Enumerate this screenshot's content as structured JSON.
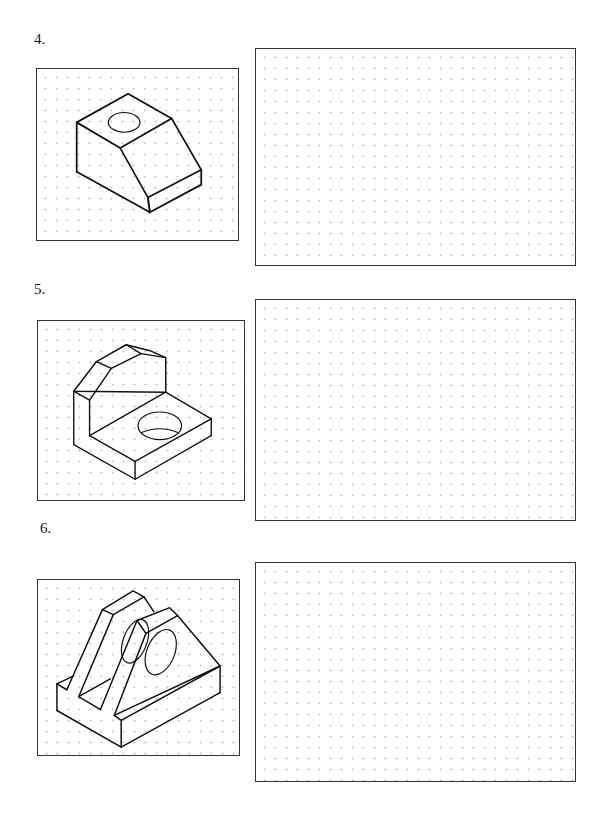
{
  "exercises": [
    {
      "number": "4.",
      "figure": "isometric-block-with-slanted-face-and-hole",
      "answer_area": "dotted-grid-blank"
    },
    {
      "number": "5.",
      "figure": "isometric-l-bracket-with-chamfered-upright-and-hole",
      "answer_area": "dotted-grid-blank"
    },
    {
      "number": "6.",
      "figure": "isometric-twin-triangular-supports-with-holes-on-base",
      "answer_area": "dotted-grid-blank"
    }
  ]
}
